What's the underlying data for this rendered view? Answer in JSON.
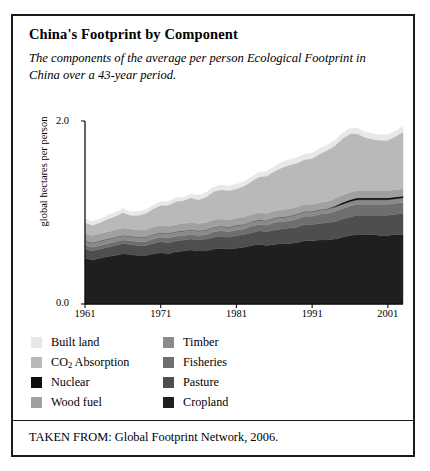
{
  "figure": {
    "title": "China's Footprint by Component",
    "subtitle": "The components of the average per person Ecological Footprint in China over a 43-year period.",
    "source": "TAKEN FROM: Global Footprint Network, 2006."
  },
  "legend": {
    "left_column": [
      {
        "label": "Built land",
        "color": "#e8e8e8",
        "key": "built_land"
      },
      {
        "label": "CO2 Absorption",
        "color": "#b9b9b9",
        "key": "co2_absorption"
      },
      {
        "label": "Nuclear",
        "color": "#0d0d0d",
        "key": "nuclear"
      },
      {
        "label": "Wood fuel",
        "color": "#a0a0a0",
        "key": "wood_fuel"
      }
    ],
    "right_column": [
      {
        "label": "Timber",
        "color": "#8a8a8a",
        "key": "timber"
      },
      {
        "label": "Fisheries",
        "color": "#6e6e6e",
        "key": "fisheries"
      },
      {
        "label": "Pasture",
        "color": "#4e4e4e",
        "key": "pasture"
      },
      {
        "label": "Cropland",
        "color": "#1f1f1f",
        "key": "cropland"
      }
    ]
  },
  "chart_data": {
    "type": "area",
    "title": "China's Footprint by Component",
    "xlabel": "",
    "ylabel": "global hectares per person",
    "ylim": [
      0.0,
      2.0
    ],
    "xlim": [
      1961,
      2003
    ],
    "y_ticks": [
      "0.0",
      "2.0"
    ],
    "x_ticks": [
      "1961",
      "1971",
      "1981",
      "1991",
      "2001"
    ],
    "grid": false,
    "legend_position": "below-plot",
    "stacked": true,
    "stack_order_bottom_to_top": [
      "Cropland",
      "Pasture",
      "Fisheries",
      "Timber",
      "Nuclear",
      "Wood fuel",
      "CO2 Absorption",
      "Built land"
    ],
    "x": [
      1961,
      1962,
      1963,
      1964,
      1965,
      1966,
      1967,
      1968,
      1969,
      1970,
      1971,
      1972,
      1973,
      1974,
      1975,
      1976,
      1977,
      1978,
      1979,
      1980,
      1981,
      1982,
      1983,
      1984,
      1985,
      1986,
      1987,
      1988,
      1989,
      1990,
      1991,
      1992,
      1993,
      1994,
      1995,
      1996,
      1997,
      1998,
      1999,
      2000,
      2001,
      2002,
      2003
    ],
    "series": [
      {
        "name": "Cropland",
        "color": "#1f1f1f",
        "values": [
          0.5,
          0.48,
          0.5,
          0.52,
          0.53,
          0.55,
          0.54,
          0.53,
          0.53,
          0.55,
          0.56,
          0.55,
          0.57,
          0.58,
          0.59,
          0.58,
          0.58,
          0.6,
          0.61,
          0.6,
          0.61,
          0.62,
          0.64,
          0.65,
          0.64,
          0.65,
          0.66,
          0.66,
          0.67,
          0.69,
          0.69,
          0.7,
          0.7,
          0.71,
          0.73,
          0.75,
          0.76,
          0.76,
          0.76,
          0.75,
          0.75,
          0.76,
          0.76
        ]
      },
      {
        "name": "Pasture",
        "color": "#4e4e4e",
        "values": [
          0.1,
          0.1,
          0.1,
          0.1,
          0.11,
          0.11,
          0.11,
          0.11,
          0.11,
          0.11,
          0.12,
          0.12,
          0.12,
          0.12,
          0.12,
          0.12,
          0.13,
          0.13,
          0.13,
          0.13,
          0.14,
          0.14,
          0.14,
          0.15,
          0.15,
          0.16,
          0.16,
          0.17,
          0.17,
          0.18,
          0.18,
          0.18,
          0.19,
          0.19,
          0.2,
          0.2,
          0.21,
          0.21,
          0.21,
          0.22,
          0.22,
          0.22,
          0.23
        ]
      },
      {
        "name": "Fisheries",
        "color": "#6e6e6e",
        "values": [
          0.04,
          0.04,
          0.04,
          0.04,
          0.04,
          0.04,
          0.04,
          0.04,
          0.04,
          0.05,
          0.05,
          0.05,
          0.05,
          0.05,
          0.05,
          0.05,
          0.05,
          0.06,
          0.06,
          0.06,
          0.06,
          0.06,
          0.07,
          0.07,
          0.07,
          0.08,
          0.08,
          0.08,
          0.09,
          0.09,
          0.09,
          0.1,
          0.1,
          0.11,
          0.11,
          0.12,
          0.12,
          0.12,
          0.12,
          0.12,
          0.12,
          0.12,
          0.12
        ]
      },
      {
        "name": "Timber",
        "color": "#8a8a8a",
        "values": [
          0.05,
          0.05,
          0.05,
          0.05,
          0.05,
          0.05,
          0.05,
          0.05,
          0.05,
          0.05,
          0.05,
          0.05,
          0.05,
          0.05,
          0.05,
          0.05,
          0.05,
          0.05,
          0.05,
          0.05,
          0.05,
          0.05,
          0.05,
          0.05,
          0.05,
          0.05,
          0.05,
          0.05,
          0.05,
          0.05,
          0.05,
          0.05,
          0.05,
          0.05,
          0.05,
          0.05,
          0.05,
          0.05,
          0.05,
          0.05,
          0.05,
          0.05,
          0.05
        ]
      },
      {
        "name": "Nuclear",
        "color": "#0d0d0d",
        "values": [
          0.0,
          0.0,
          0.0,
          0.0,
          0.0,
          0.0,
          0.0,
          0.0,
          0.0,
          0.0,
          0.0,
          0.0,
          0.0,
          0.0,
          0.0,
          0.0,
          0.0,
          0.0,
          0.0,
          0.0,
          0.0,
          0.0,
          0.0,
          0.0,
          0.0,
          0.0,
          0.0,
          0.0,
          0.0,
          0.0,
          0.0,
          0.0,
          0.0,
          0.01,
          0.02,
          0.02,
          0.02,
          0.02,
          0.02,
          0.02,
          0.02,
          0.02,
          0.02
        ]
      },
      {
        "name": "Wood fuel",
        "color": "#a0a0a0",
        "values": [
          0.08,
          0.08,
          0.08,
          0.08,
          0.08,
          0.08,
          0.08,
          0.08,
          0.08,
          0.08,
          0.08,
          0.08,
          0.08,
          0.08,
          0.08,
          0.08,
          0.08,
          0.08,
          0.08,
          0.08,
          0.08,
          0.08,
          0.08,
          0.08,
          0.08,
          0.08,
          0.08,
          0.08,
          0.08,
          0.08,
          0.08,
          0.08,
          0.08,
          0.08,
          0.08,
          0.08,
          0.08,
          0.08,
          0.08,
          0.08,
          0.08,
          0.08,
          0.08
        ]
      },
      {
        "name": "CO2 Absorption",
        "color": "#b9b9b9",
        "values": [
          0.12,
          0.11,
          0.12,
          0.14,
          0.15,
          0.17,
          0.15,
          0.16,
          0.18,
          0.2,
          0.22,
          0.23,
          0.25,
          0.25,
          0.27,
          0.26,
          0.28,
          0.31,
          0.32,
          0.32,
          0.32,
          0.34,
          0.36,
          0.39,
          0.41,
          0.43,
          0.46,
          0.48,
          0.48,
          0.49,
          0.5,
          0.53,
          0.56,
          0.58,
          0.62,
          0.64,
          0.62,
          0.58,
          0.56,
          0.55,
          0.55,
          0.58,
          0.62
        ]
      },
      {
        "name": "Built land",
        "color": "#e8e8e8",
        "values": [
          0.04,
          0.04,
          0.04,
          0.04,
          0.04,
          0.04,
          0.04,
          0.04,
          0.04,
          0.04,
          0.04,
          0.04,
          0.04,
          0.04,
          0.04,
          0.05,
          0.05,
          0.05,
          0.05,
          0.05,
          0.05,
          0.05,
          0.05,
          0.05,
          0.05,
          0.05,
          0.06,
          0.06,
          0.06,
          0.06,
          0.06,
          0.06,
          0.06,
          0.06,
          0.06,
          0.06,
          0.06,
          0.06,
          0.06,
          0.06,
          0.06,
          0.06,
          0.06
        ]
      }
    ]
  }
}
